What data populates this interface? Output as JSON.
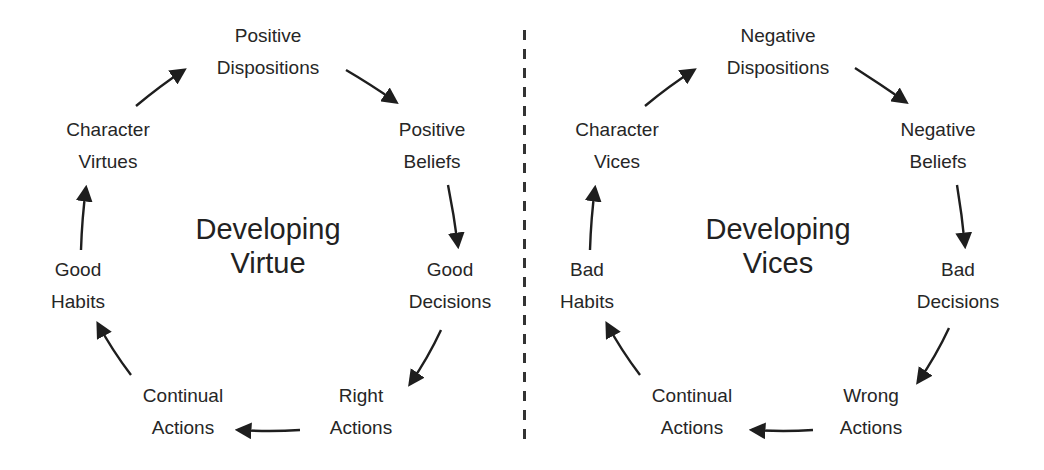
{
  "left_cycle": {
    "title": [
      "Developing",
      "Virtue"
    ],
    "nodes": [
      {
        "lines": [
          "Positive",
          "Dispositions"
        ]
      },
      {
        "lines": [
          "Positive",
          "Beliefs"
        ]
      },
      {
        "lines": [
          "Good",
          "Decisions"
        ]
      },
      {
        "lines": [
          "Right",
          "Actions"
        ]
      },
      {
        "lines": [
          "Continual",
          "Actions"
        ]
      },
      {
        "lines": [
          "Good",
          "Habits"
        ]
      },
      {
        "lines": [
          "Character",
          "Virtues"
        ]
      }
    ]
  },
  "right_cycle": {
    "title": [
      "Developing",
      "Vices"
    ],
    "nodes": [
      {
        "lines": [
          "Negative",
          "Dispositions"
        ]
      },
      {
        "lines": [
          "Negative",
          "Beliefs"
        ]
      },
      {
        "lines": [
          "Bad",
          "Decisions"
        ]
      },
      {
        "lines": [
          "Wrong",
          "Actions"
        ]
      },
      {
        "lines": [
          "Continual",
          "Actions"
        ]
      },
      {
        "lines": [
          "Bad",
          "Habits"
        ]
      },
      {
        "lines": [
          "Character",
          "Vices"
        ]
      }
    ]
  },
  "colors": {
    "text": "#262626",
    "arrow": "#1e1e1e",
    "divider": "#333333"
  }
}
